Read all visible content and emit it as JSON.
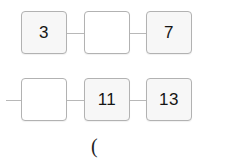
{
  "diagram": {
    "background_color": "#ffffff",
    "node_fill": "#f7f7f7",
    "node_fill_empty": "#ffffff",
    "node_border_color": "#b2b2b2",
    "link_color": "#b8b8b8",
    "text_color": "#151515",
    "rows": [
      {
        "id": "row-1",
        "nodes": [
          {
            "id": "r1c1",
            "value": "3",
            "empty": false,
            "x": 21,
            "y": 11
          },
          {
            "id": "r1c2",
            "value": "",
            "empty": true,
            "x": 84,
            "y": 11
          },
          {
            "id": "r1c3",
            "value": "7",
            "empty": false,
            "x": 146,
            "y": 11
          }
        ],
        "links": [
          {
            "id": "r1l1",
            "x": 67,
            "y": 33,
            "width": 17
          },
          {
            "id": "r1l2",
            "x": 130,
            "y": 33,
            "width": 16
          }
        ]
      },
      {
        "id": "row-2",
        "nodes": [
          {
            "id": "r2c1",
            "value": "",
            "empty": true,
            "x": 21,
            "y": 78
          },
          {
            "id": "r2c2",
            "value": "11",
            "empty": false,
            "x": 84,
            "y": 78
          },
          {
            "id": "r2c3",
            "value": "13",
            "empty": false,
            "x": 146,
            "y": 78
          }
        ],
        "links": [
          {
            "id": "r2l0",
            "x": 6,
            "y": 100,
            "width": 15
          },
          {
            "id": "r2l1",
            "x": 67,
            "y": 100,
            "width": 17
          },
          {
            "id": "r2l2",
            "x": 130,
            "y": 100,
            "width": 16
          }
        ]
      }
    ],
    "annotation": {
      "text": "(",
      "x": 91,
      "y": 136
    }
  }
}
